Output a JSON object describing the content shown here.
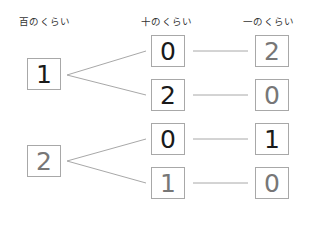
{
  "headers": {
    "hundreds": "百のくらい",
    "tens": "十のくらい",
    "ones": "一のくらい"
  },
  "tree": {
    "hundreds": [
      {
        "digit": "1",
        "style": "dark"
      },
      {
        "digit": "2",
        "style": "gray"
      }
    ],
    "tens": [
      {
        "digit": "0",
        "style": "dark"
      },
      {
        "digit": "2",
        "style": "dark"
      },
      {
        "digit": "0",
        "style": "dark"
      },
      {
        "digit": "1",
        "style": "gray"
      }
    ],
    "ones": [
      {
        "digit": "2",
        "style": "gray"
      },
      {
        "digit": "0",
        "style": "gray"
      },
      {
        "digit": "1",
        "style": "dark"
      },
      {
        "digit": "0",
        "style": "gray"
      }
    ]
  },
  "colors": {
    "line": "#a8a8a8",
    "box_border": "#a8a8a8",
    "digit_dark": "#1a1a1a",
    "digit_gray": "#777777"
  }
}
